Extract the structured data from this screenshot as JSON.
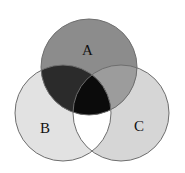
{
  "diagram": {
    "type": "venn",
    "sets": [
      {
        "id": "A",
        "label": "A",
        "cx": 89,
        "cy": 67,
        "r": 48
      },
      {
        "id": "B",
        "label": "B",
        "cx": 63,
        "cy": 113,
        "r": 48
      },
      {
        "id": "C",
        "label": "C",
        "cx": 121,
        "cy": 113,
        "r": 48
      }
    ],
    "region_colors": {
      "A_only": "#8c8c8c",
      "B_only": "#e2e2e2",
      "C_only": "#d6d6d6",
      "A_and_B_only": "#2b2b2b",
      "A_and_C_only": "#9c9c9c",
      "B_and_C_only": "#ffffff",
      "A_and_B_and_C": "#0b0b0b"
    },
    "stroke": "#6e6e6e"
  }
}
